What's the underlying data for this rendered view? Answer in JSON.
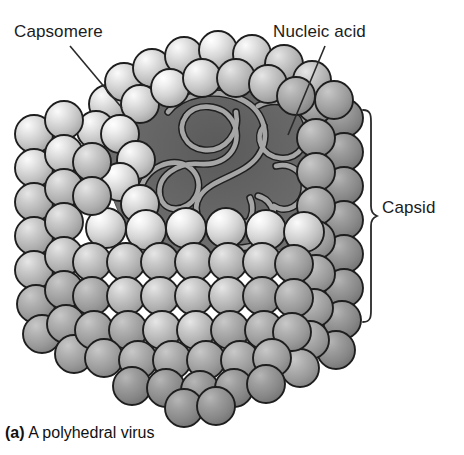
{
  "figure": {
    "caption_marker": "(a)",
    "caption_text": "A polyhedral virus",
    "background_color": "#ffffff"
  },
  "labels": {
    "capsomere": "Capsomere",
    "nucleic_acid": "Nucleic acid",
    "capsid": "Capsid"
  },
  "icons": {
    "capsid_brace": "curly-brace-icon",
    "capsomere_leader": "leader-line-icon",
    "nucleic_acid_leader": "leader-line-icon"
  },
  "palette": {
    "outline": "#1e1e1e",
    "sphere_light": "#d2d2d2",
    "sphere_mid": "#b4b4b4",
    "sphere_shadow": "#8e8e8e",
    "sphere_dark": "#7d7d7d",
    "highlight": "#f2f2f2",
    "cavity_background": "#6c6c6c",
    "cavity_inner": "#5e5e5e",
    "nucleic_strand": "#a0a0a0",
    "label_color": "#1c1c1c",
    "leader_line": "#3a3a3a"
  },
  "geometry": {
    "capsid_brace": {
      "top": 110,
      "bottom": 322,
      "x": 363,
      "tip_x": 377
    },
    "capsomere_leader": {
      "x1": 70,
      "y1": 46,
      "x2": 122,
      "y2": 108
    },
    "nucleic_acid_leader": {
      "x1": 325,
      "y1": 46,
      "x2": 288,
      "y2": 135
    },
    "body": {
      "left": 16,
      "right": 356,
      "top": 40,
      "bottom": 410
    }
  },
  "structure_notes": {
    "capsomere_count_visible": "approximately 140 spherical subunits",
    "cutaway": "upper front section removed to reveal interior",
    "interior_contents": "coiled nucleic acid strand"
  }
}
